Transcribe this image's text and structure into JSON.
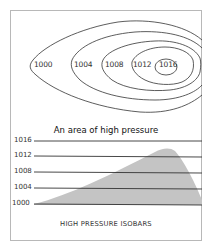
{
  "top_diagram": {
    "contour_labels": [
      "1000",
      "1004",
      "1008",
      "1012",
      "1016"
    ]
  },
  "title": "An area of high pressure",
  "profile": {
    "isobar_labels": [
      "1016",
      "1012",
      "1008",
      "1004",
      "1000"
    ],
    "fill_color": "#c4c4c4",
    "line_color": "#333333"
  },
  "caption": "HIGH PRESSURE ISOBARS"
}
